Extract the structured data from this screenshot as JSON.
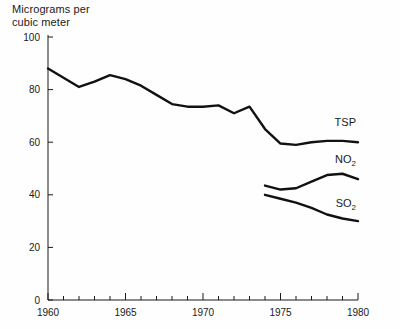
{
  "chart_data": {
    "type": "line",
    "title": "",
    "ylabel": "Micrograms per\ncubic meter",
    "xlabel": "",
    "xlim": [
      1960,
      1980
    ],
    "ylim": [
      0,
      100
    ],
    "grid": false,
    "legend_position": "right-inline",
    "y_ticks": [
      0,
      20,
      40,
      60,
      80,
      100
    ],
    "y_tick_labels": [
      "0",
      "20",
      "40",
      "60",
      "80",
      "100"
    ],
    "x_ticks": [
      1960,
      1965,
      1970,
      1975,
      1980
    ],
    "x_tick_labels": [
      "1960",
      "1965",
      "1970",
      "1975",
      "1980"
    ],
    "x_minor_tick_step": 1,
    "series": [
      {
        "name": "TSP",
        "label": "TSP",
        "label_main": "TSP",
        "label_sub": "",
        "color": "#111111",
        "x": [
          1960,
          1961,
          1962,
          1963,
          1964,
          1965,
          1966,
          1967,
          1968,
          1969,
          1970,
          1971,
          1972,
          1973,
          1974,
          1975,
          1976,
          1977,
          1978,
          1979,
          1980
        ],
        "values": [
          88,
          84.5,
          81,
          83,
          85.5,
          84,
          81.5,
          78,
          74.5,
          73.5,
          73.5,
          74,
          71,
          73.5,
          65,
          59.5,
          59,
          60,
          60.5,
          60.5,
          60
        ]
      },
      {
        "name": "NO2",
        "label": "NO₂",
        "label_main": "NO",
        "label_sub": "2",
        "color": "#111111",
        "x": [
          1974,
          1975,
          1976,
          1977,
          1978,
          1979,
          1980
        ],
        "values": [
          43.5,
          42,
          42.5,
          45,
          47.5,
          48,
          46
        ]
      },
      {
        "name": "SO2",
        "label": "SO₂",
        "label_main": "SO",
        "label_sub": "2",
        "color": "#111111",
        "x": [
          1974,
          1975,
          1976,
          1977,
          1978,
          1979,
          1980
        ],
        "values": [
          40,
          38.5,
          37,
          35,
          32.5,
          31,
          30
        ]
      }
    ]
  },
  "axis": {
    "y_title": "Micrograms per\ncubic meter"
  }
}
